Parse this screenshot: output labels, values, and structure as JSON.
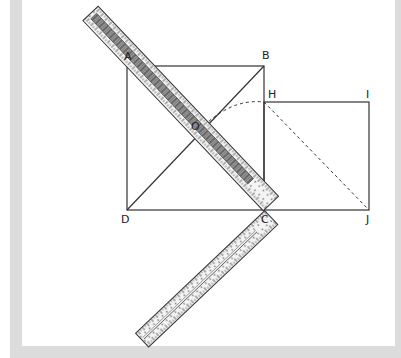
{
  "figure": {
    "colors": {
      "frame": "#dcdcdc",
      "panel": "#ffffff",
      "line": "#333333",
      "ruler_fill": "#f4f4f4",
      "ruler_band": "#8a8a8a"
    },
    "points": {
      "A": {
        "label": "A",
        "x": 127,
        "y": 66
      },
      "B": {
        "label": "B",
        "x": 264,
        "y": 66
      },
      "C": {
        "label": "C",
        "x": 264,
        "y": 210
      },
      "D": {
        "label": "D",
        "x": 127,
        "y": 210
      },
      "O": {
        "label": "O",
        "x": 196,
        "y": 134
      },
      "H": {
        "label": "H",
        "x": 264,
        "y": 102
      },
      "I": {
        "label": "I",
        "x": 369,
        "y": 102
      },
      "J": {
        "label": "J",
        "x": 369,
        "y": 210
      }
    },
    "labels": {
      "A": "A",
      "B": "B",
      "C": "C",
      "D": "D",
      "O": "O",
      "H": "H",
      "I": "I",
      "J": "J"
    },
    "shapes": [
      {
        "type": "square",
        "name": "ABCD"
      },
      {
        "type": "segment",
        "name": "BD-diagonal",
        "style": "solid"
      },
      {
        "type": "square",
        "name": "HIJC"
      },
      {
        "type": "segment",
        "name": "HJ-diagonal",
        "style": "dashed"
      },
      {
        "type": "arc",
        "name": "arc-O-to-H",
        "style": "dashed"
      },
      {
        "type": "carpenter-square",
        "name": "L-ruler",
        "corner": "C"
      }
    ]
  }
}
